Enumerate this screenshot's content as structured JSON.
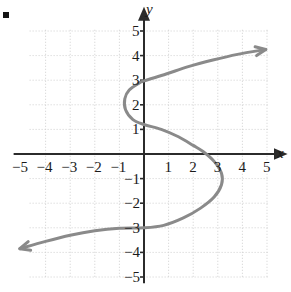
{
  "figure": {
    "bullet_marker": "square-bullet",
    "background_color": "#ffffff",
    "grid_color": "#cfcfcf",
    "axis_color": "#2b2b2b",
    "curve_color": "#8a8a8a"
  },
  "chart_data": {
    "type": "line",
    "title": "",
    "subtitle": "",
    "xlabel": "x",
    "ylabel": "y",
    "xlim": [
      -5.5,
      5.5
    ],
    "ylim": [
      -5.5,
      5.5
    ],
    "grid": true,
    "grid_step": 1,
    "legend": "none",
    "orientation": "sideways-cubic",
    "xticks": [
      -5,
      -4,
      -3,
      -2,
      -1,
      1,
      2,
      3,
      4,
      5
    ],
    "xtick_labels": [
      "−5",
      "−4",
      "−3",
      "−2",
      "−1",
      "1",
      "2",
      "3",
      "4",
      "5"
    ],
    "yticks": [
      5,
      4,
      3,
      2,
      1,
      -1,
      -2,
      -3,
      -4,
      -5
    ],
    "ytick_labels": [
      "5",
      "4",
      "3",
      "2",
      "1",
      "−1",
      "−2",
      "−3",
      "−4",
      "−5"
    ],
    "series": [
      {
        "name": "curve",
        "style": "solid",
        "color": "#8a8a8a",
        "width": 3,
        "arrow_start": true,
        "arrow_end": true,
        "points": [
          [
            -5.05,
            -3.85
          ],
          [
            -4.0,
            -3.55
          ],
          [
            -3.0,
            -3.3
          ],
          [
            -2.0,
            -3.12
          ],
          [
            -1.0,
            -3.02
          ],
          [
            0.0,
            -3.0
          ],
          [
            0.8,
            -2.9
          ],
          [
            1.6,
            -2.6
          ],
          [
            2.3,
            -2.2
          ],
          [
            2.85,
            -1.75
          ],
          [
            3.15,
            -1.25
          ],
          [
            3.15,
            -0.78
          ],
          [
            2.85,
            -0.3
          ],
          [
            2.4,
            0.1
          ],
          [
            2.0,
            0.35
          ],
          [
            1.4,
            0.7
          ],
          [
            0.7,
            1.0
          ],
          [
            0.0,
            1.2
          ],
          [
            -0.45,
            1.4
          ],
          [
            -0.75,
            1.8
          ],
          [
            -0.78,
            2.25
          ],
          [
            -0.6,
            2.6
          ],
          [
            -0.2,
            2.88
          ],
          [
            0.0,
            2.97
          ],
          [
            0.9,
            3.25
          ],
          [
            1.8,
            3.55
          ],
          [
            2.8,
            3.82
          ],
          [
            3.8,
            4.05
          ],
          [
            4.95,
            4.25
          ]
        ]
      }
    ]
  },
  "axes": {
    "x_axis_name": "x",
    "y_axis_name": "y"
  }
}
